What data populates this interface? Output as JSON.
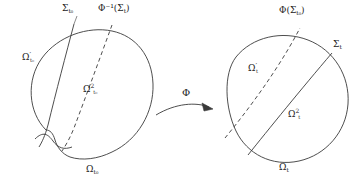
{
  "figure": {
    "type": "mathematical-domain-mapping-diagram",
    "stroke_color": "#3a3a3a",
    "text_color": "#1c1c1c",
    "background_color": "#ffffff"
  },
  "map": {
    "name": "Φ",
    "direction": "left-to-right",
    "arrow_style": "curved-solid-with-filled-head"
  },
  "left_domain": {
    "name": "reference-domain",
    "outer_label": "Ω",
    "outer_label_sub": "t₀",
    "subregion_prime_label": "Ω",
    "subregion_prime_mark": "′",
    "subregion_prime_sub": "t₀",
    "subregion_two_label": "Ω",
    "subregion_two_sup": "2",
    "subregion_two_sub": "t₀",
    "interface_solid_label": "Σ",
    "interface_solid_sub": "t₀",
    "interface_dashed_label": "Φ⁻¹(Σ",
    "interface_dashed_sub": "t",
    "interface_dashed_tail": ")"
  },
  "right_domain": {
    "name": "current-domain",
    "outer_label": "Ω",
    "outer_label_sub": "t",
    "subregion_prime_label": "Ω",
    "subregion_prime_mark": "′",
    "subregion_prime_sub": "t",
    "subregion_two_label": "Ω",
    "subregion_two_sup": "2",
    "subregion_two_sub": "t",
    "interface_solid_label": "Σ",
    "interface_solid_sub": "t",
    "interface_dashed_label": "Φ(Σ",
    "interface_dashed_sub": "t₀",
    "interface_dashed_tail": ")"
  }
}
